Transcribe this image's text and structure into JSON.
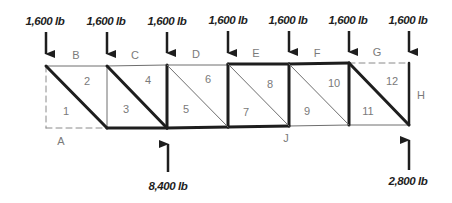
{
  "diagram": {
    "type": "truss-bows-notation",
    "colors": {
      "ink": "#1e1e1e",
      "label": "#7a7a7a",
      "thin": "#6e6e6e"
    },
    "top_loads": [
      {
        "label": "1,600 lb",
        "node": 0
      },
      {
        "label": "1,600 lb",
        "node": 1
      },
      {
        "label": "1,600 lb",
        "node": 2
      },
      {
        "label": "1,600 lb",
        "node": 3
      },
      {
        "label": "1,600 lb",
        "node": 4
      },
      {
        "label": "1,600 lb",
        "node": 5
      },
      {
        "label": "1,600 lb",
        "node": 6
      }
    ],
    "reactions": [
      {
        "label": "8,400 lb",
        "node": 2
      },
      {
        "label": "2,800 lb",
        "node": 6
      }
    ],
    "space_letters": {
      "B": "B",
      "C": "C",
      "D": "D",
      "E": "E",
      "F": "F",
      "G": "G",
      "H": "H",
      "A": "A",
      "J": "J"
    },
    "panel_numbers": [
      "1",
      "2",
      "3",
      "4",
      "5",
      "6",
      "7",
      "8",
      "9",
      "10",
      "11",
      "12"
    ]
  }
}
